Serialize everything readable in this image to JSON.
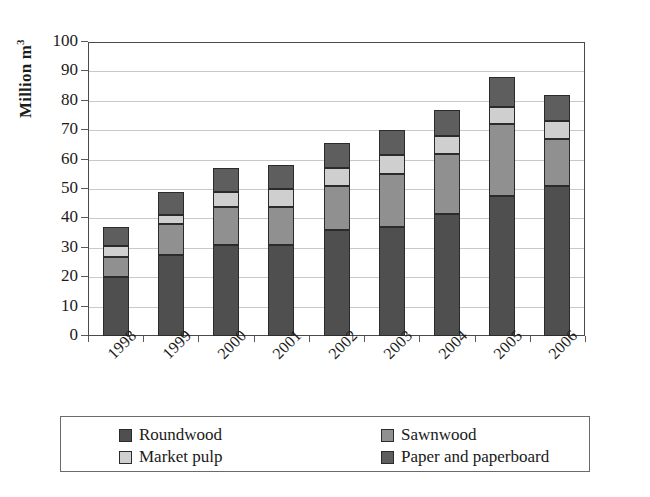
{
  "chart_data": {
    "type": "bar",
    "subtype": "stacked-column",
    "title": "",
    "xlabel": "",
    "ylabel": "Million m3",
    "ylabel_display": "Million m",
    "ylabel_superscript": "3",
    "ylim": [
      0,
      100
    ],
    "ytick_step": 10,
    "yticks": [
      0,
      10,
      20,
      30,
      40,
      50,
      60,
      70,
      80,
      90,
      100
    ],
    "grid": true,
    "grid_axis": "y",
    "legend_position": "bottom",
    "categories": [
      "1998",
      "1999",
      "2000",
      "2001",
      "2002",
      "2003",
      "2004",
      "2005",
      "2006"
    ],
    "series": [
      {
        "name": "Roundwood",
        "color": "#4f4f4f",
        "values": [
          20.0,
          27.5,
          31.0,
          31.0,
          36.0,
          37.0,
          41.5,
          47.5,
          51.0
        ]
      },
      {
        "name": "Sawnwood",
        "color": "#909090",
        "values": [
          7.0,
          10.5,
          13.0,
          13.0,
          15.0,
          18.0,
          20.5,
          24.5,
          16.0
        ]
      },
      {
        "name": "Market pulp",
        "color": "#cfcfcf",
        "values": [
          3.5,
          3.0,
          5.0,
          6.0,
          6.0,
          6.5,
          6.0,
          6.0,
          6.0
        ]
      },
      {
        "name": "Paper and paperboard",
        "color": "#5e5e5e",
        "values": [
          6.5,
          8.0,
          8.0,
          8.0,
          8.5,
          8.5,
          9.0,
          10.0,
          9.0
        ]
      }
    ],
    "totals": [
      37.0,
      49.0,
      57.0,
      58.0,
      65.5,
      70.0,
      77.0,
      88.0,
      82.0
    ]
  },
  "legend": {
    "entries": [
      {
        "label": "Roundwood",
        "color": "#4f4f4f"
      },
      {
        "label": "Sawnwood",
        "color": "#909090"
      },
      {
        "label": "Market pulp",
        "color": "#cfcfcf"
      },
      {
        "label": "Paper and paperboard",
        "color": "#5e5e5e"
      }
    ]
  }
}
